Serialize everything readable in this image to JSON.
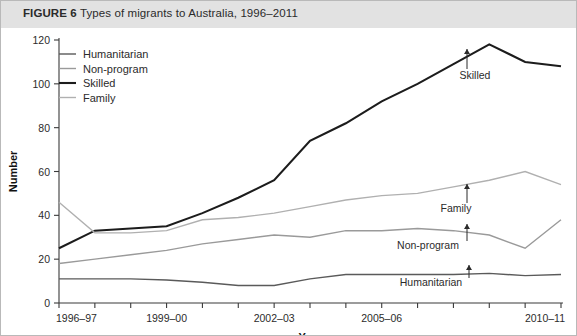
{
  "figure": {
    "label": "FIGURE 6",
    "title": "Types of migrants to Australia, 1996–2011",
    "banner_color": "#e2e2e2",
    "border_color": "#b9b9b9",
    "background": "#ffffff"
  },
  "legend": {
    "position": "top-left-inside",
    "items": [
      {
        "label": "Humanitarian",
        "color": "#5a5a5a",
        "width": 1.4
      },
      {
        "label": "Non-program",
        "color": "#9a9a9a",
        "width": 1.4
      },
      {
        "label": "Skilled",
        "color": "#1c1c1c",
        "width": 2.1
      },
      {
        "label": "Family",
        "color": "#b0b0b0",
        "width": 1.4
      }
    ]
  },
  "annotations": [
    {
      "name": "Skilled",
      "text": "Skilled",
      "x_index": 12,
      "value": 118,
      "label_x": 474,
      "label_y": 78,
      "arrow_x": 466,
      "arrow_top": 48,
      "arrow_bottom": 68
    },
    {
      "name": "Family",
      "text": "Family",
      "x_index": 11,
      "value": 56,
      "label_x": 455,
      "label_y": 211,
      "arrow_x": 466,
      "arrow_top": 183,
      "arrow_bottom": 202
    },
    {
      "name": "Non-program",
      "text": "Non-program",
      "x_index": 11,
      "value": 31,
      "label_x": 427,
      "label_y": 248,
      "arrow_x": 466,
      "arrow_top": 223,
      "arrow_bottom": 240
    },
    {
      "name": "Humanitarian",
      "text": "Humanitarian",
      "x_index": 12,
      "value": 13,
      "label_x": 430,
      "label_y": 285,
      "arrow_x": 468,
      "arrow_top": 264,
      "arrow_bottom": 277
    }
  ],
  "chart_data": {
    "type": "line",
    "title": "Types of migrants to Australia, 1996–2011",
    "xlabel": "Year",
    "ylabel": "Number",
    "ylim": [
      0,
      120
    ],
    "yticks": [
      0,
      20,
      40,
      60,
      80,
      100,
      120
    ],
    "grid": false,
    "legend_position": "upper left",
    "categories": [
      "1996-97",
      "1997-98",
      "1998-99",
      "1999-00",
      "2000-01",
      "2001-02",
      "2002-03",
      "2003-04",
      "2004-05",
      "2005-06",
      "2006-07",
      "2007-08",
      "2008-09",
      "2009-10",
      "2010-11"
    ],
    "xtick_labels": [
      "1996–97",
      "1999–00",
      "2002–03",
      "2005–06",
      "2010–11"
    ],
    "xtick_indices": [
      0,
      3,
      6,
      9,
      14
    ],
    "series": [
      {
        "name": "Humanitarian",
        "color": "#5a5a5a",
        "values": [
          11,
          11,
          11,
          10.5,
          9.5,
          8,
          8,
          11,
          13,
          13,
          13,
          13,
          13.5,
          12.5,
          13
        ]
      },
      {
        "name": "Non-program",
        "color": "#9a9a9a",
        "values": [
          18,
          20,
          22,
          24,
          27,
          29,
          31,
          30,
          33,
          33,
          34,
          33,
          31,
          25,
          38
        ]
      },
      {
        "name": "Skilled",
        "color": "#1c1c1c",
        "values": [
          25,
          33,
          34,
          35,
          41,
          48,
          56,
          74,
          82,
          92,
          100,
          109,
          118,
          110,
          108
        ]
      },
      {
        "name": "Family",
        "color": "#b0b0b0",
        "values": [
          46,
          32,
          32,
          33,
          38,
          39,
          41,
          44,
          47,
          49,
          50,
          53,
          56,
          60,
          54
        ]
      }
    ]
  }
}
